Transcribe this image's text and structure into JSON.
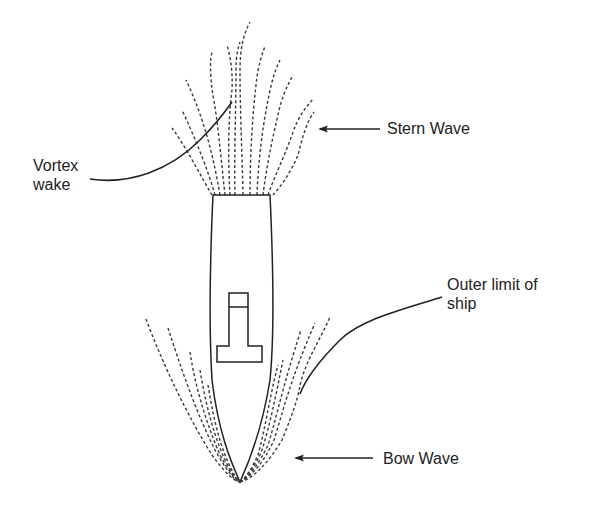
{
  "diagram": {
    "type": "labeled-schematic",
    "labels": {
      "vortex_wake_line1": "Vortex",
      "vortex_wake_line2": "wake",
      "stern_wave": "Stern Wave",
      "outer_limit_line1": "Outer limit of",
      "outer_limit_line2": "ship",
      "bow_wave": "Bow Wave"
    },
    "elements": [
      {
        "id": "hull",
        "shape": "elongated hull with pointed bow at bottom, flat stern at top"
      },
      {
        "id": "superstructure",
        "shape": "T-shaped deck house with small square on top"
      },
      {
        "id": "stern-wake-lines",
        "style": "dashed",
        "count": 11
      },
      {
        "id": "bow-wave-lines-left",
        "style": "dashed",
        "count": 5
      },
      {
        "id": "bow-wave-lines-right",
        "style": "dashed",
        "count": 5
      }
    ],
    "colors": {
      "line": "#222222",
      "background": "#ffffff"
    }
  }
}
